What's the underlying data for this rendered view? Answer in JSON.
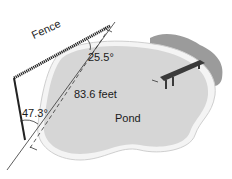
{
  "figure": {
    "labels": {
      "fence": "Fence",
      "angle_top": "25.5°",
      "angle_bottom": "47.3°",
      "distance": "83.6 feet",
      "pond": "Pond"
    },
    "colors": {
      "pond_fill": "#d6d6d6",
      "pond_rim": "#f2f2f2",
      "shadow": "#8a8a8a",
      "fence": "#222222",
      "dock": "#3a3a3a"
    }
  }
}
